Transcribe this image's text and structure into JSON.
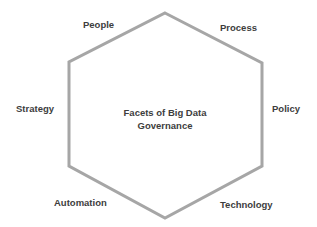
{
  "diagram": {
    "title_line1": "Facets of Big Data",
    "title_line2": "Governance",
    "shape": "hexagon",
    "outline_color": "#a6a6a6",
    "facets": [
      {
        "label": "People"
      },
      {
        "label": "Process"
      },
      {
        "label": "Policy"
      },
      {
        "label": "Technology"
      },
      {
        "label": "Automation"
      },
      {
        "label": "Strategy"
      }
    ]
  }
}
